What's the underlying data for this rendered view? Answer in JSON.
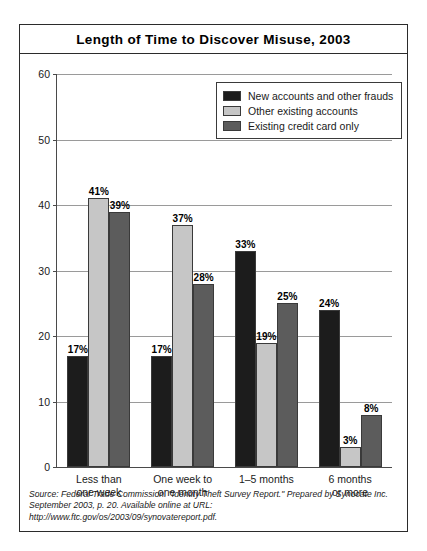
{
  "figure": {
    "title": "Length of Time to Discover Misuse, 2003"
  },
  "legend": {
    "position": "top-right-inside-plot",
    "entries": [
      {
        "label": "New accounts and other frauds",
        "color": "#1c1c1c"
      },
      {
        "label": "Other existing accounts",
        "color": "#c6c6c6"
      },
      {
        "label": "Existing credit card only",
        "color": "#5c5c5c"
      }
    ]
  },
  "axis": {
    "y_ticks": [
      "0",
      "10",
      "20",
      "30",
      "40",
      "50",
      "60"
    ]
  },
  "categories_multiline": [
    "Less than\none week",
    "One week to\none month",
    "1–5 months",
    "6 months\nor more"
  ],
  "bar_labels": {
    "g0": [
      "17%",
      "41%",
      "39%"
    ],
    "g1": [
      "17%",
      "37%",
      "28%"
    ],
    "g2": [
      "33%",
      "19%",
      "25%"
    ],
    "g3": [
      "24%",
      "3%",
      "8%"
    ]
  },
  "source": {
    "line1": "Source: Federal Trade Commission. \"Identity Theft Survey Report.\" Prepared by Synocate Inc.",
    "line2": "September 2003, p. 20. Available online at URL: http://www.ftc.gov/os/2003/09/synovatereport.pdf."
  },
  "chart_data": {
    "type": "bar",
    "title": "Length of Time to Discover Misuse, 2003",
    "subtitle": "",
    "xlabel": "",
    "ylabel": "",
    "ylim": [
      0,
      60
    ],
    "ytick_values": [
      0,
      10,
      20,
      30,
      40,
      50,
      60
    ],
    "grid": true,
    "grid_axis": "y",
    "legend_position": "upper right (inside axes)",
    "categories": [
      "Less than one week",
      "One week to one month",
      "1–5 months",
      "6 months or more"
    ],
    "series": [
      {
        "name": "New accounts and other frauds",
        "color": "#1c1c1c",
        "values": [
          17,
          17,
          33,
          24
        ],
        "labels": [
          "17%",
          "17%",
          "33%",
          "24%"
        ]
      },
      {
        "name": "Other existing accounts",
        "color": "#c6c6c6",
        "values": [
          41,
          37,
          19,
          3
        ],
        "labels": [
          "41%",
          "37%",
          "19%",
          "3%"
        ]
      },
      {
        "name": "Existing credit card only",
        "color": "#5c5c5c",
        "values": [
          39,
          28,
          25,
          8
        ],
        "labels": [
          "39%",
          "28%",
          "25%",
          "8%"
        ]
      }
    ],
    "value_unit": "percent",
    "annotations": [
      "Source: Federal Trade Commission. \"Identity Theft Survey Report.\" Prepared by Synocate Inc.",
      "September 2003, p. 20. Available online at URL: http://www.ftc.gov/os/2003/09/synovatereport.pdf."
    ]
  }
}
